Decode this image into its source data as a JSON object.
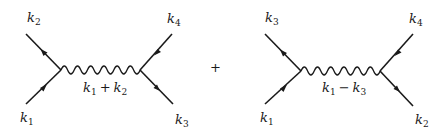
{
  "diagrams": [
    {
      "name": "s-channel",
      "vertices": {
        "left": [
          61,
          70
        ],
        "right": [
          140,
          70
        ]
      },
      "external_legs": [
        {
          "label": "k",
          "sub": "2",
          "from": [
            26,
            34
          ],
          "to": [
            61,
            70
          ],
          "label_pos": [
            27,
            22
          ],
          "direction": "outgoing-from-vertex"
        },
        {
          "label": "k",
          "sub": "1",
          "from": [
            26,
            104
          ],
          "to": [
            61,
            70
          ],
          "label_pos": [
            20,
            122
          ],
          "direction": "incoming-to-vertex"
        },
        {
          "label": "k",
          "sub": "4",
          "from": [
            172,
            34
          ],
          "to": [
            140,
            70
          ],
          "label_pos": [
            167,
            23
          ],
          "direction": "incoming-to-vertex"
        },
        {
          "label": "k",
          "sub": "3",
          "from": [
            140,
            70
          ],
          "to": [
            173,
            104
          ],
          "label_pos": [
            175,
            124
          ],
          "direction": "outgoing-from-vertex"
        }
      ],
      "propagator": {
        "type": "photon",
        "label_k1": "k",
        "sub1": "1",
        "op": "+",
        "label_k2": "k",
        "sub2": "2",
        "label_pos": [
          83,
          92
        ]
      }
    },
    {
      "name": "t-channel",
      "vertices": {
        "left": [
          301,
          71
        ],
        "right": [
          380,
          71
        ]
      },
      "external_legs": [
        {
          "label": "k",
          "sub": "3",
          "from": [
            265,
            34
          ],
          "to": [
            301,
            71
          ],
          "label_pos": [
            265,
            22
          ],
          "direction": "outgoing-from-vertex"
        },
        {
          "label": "k",
          "sub": "1",
          "from": [
            265,
            104
          ],
          "to": [
            301,
            71
          ],
          "label_pos": [
            260,
            122
          ],
          "direction": "incoming-to-vertex"
        },
        {
          "label": "k",
          "sub": "4",
          "from": [
            413,
            34
          ],
          "to": [
            380,
            71
          ],
          "label_pos": [
            409,
            23
          ],
          "direction": "incoming-to-vertex"
        },
        {
          "label": "k",
          "sub": "2",
          "from": [
            380,
            71
          ],
          "to": [
            413,
            106
          ],
          "label_pos": [
            415,
            124
          ],
          "direction": "outgoing-from-vertex"
        }
      ],
      "propagator": {
        "type": "photon",
        "label_k1": "k",
        "sub1": "1",
        "op": "−",
        "label_k2": "k",
        "sub2": "3",
        "label_pos": [
          322,
          92
        ]
      }
    }
  ],
  "between": {
    "symbol": "+",
    "pos": [
      210,
      72
    ]
  }
}
